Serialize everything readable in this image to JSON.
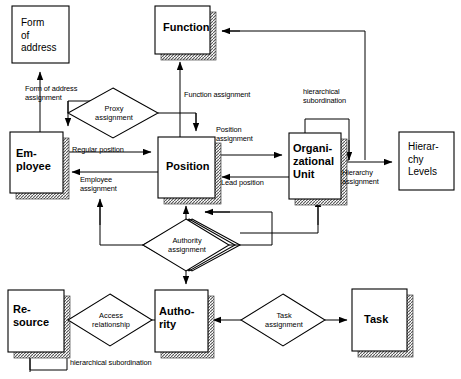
{
  "diagram": {
    "background": "#ffffff",
    "line_color": "#000000",
    "entities": [
      {
        "id": "form-of-address",
        "label": "Form\nof\naddress",
        "style": "plain",
        "x": 12,
        "y": 6,
        "w": 57,
        "h": 57
      },
      {
        "id": "function",
        "label": "Function",
        "style": "shadow",
        "x": 155,
        "y": 6,
        "w": 55,
        "h": 48
      },
      {
        "id": "employee",
        "label": "Em-\nployee",
        "style": "shadow",
        "x": 10,
        "y": 132,
        "w": 53,
        "h": 61
      },
      {
        "id": "position",
        "label": "Position",
        "style": "shadow",
        "x": 158,
        "y": 137,
        "w": 57,
        "h": 61
      },
      {
        "id": "organizational-unit",
        "label": "Organi-\nzational\nUnit",
        "style": "shadow",
        "x": 289,
        "y": 133,
        "w": 52,
        "h": 66
      },
      {
        "id": "hierarchy-levels",
        "label": "Hierar-\nchy\nLevels",
        "style": "plain",
        "x": 399,
        "y": 132,
        "w": 55,
        "h": 58
      },
      {
        "id": "resource",
        "label": "Re-\nsource",
        "style": "shadow",
        "x": 8,
        "y": 290,
        "w": 56,
        "h": 62
      },
      {
        "id": "authority",
        "label": "Autho-\nrity",
        "style": "shadow",
        "x": 155,
        "y": 290,
        "w": 53,
        "h": 62
      },
      {
        "id": "task",
        "label": "Task",
        "style": "shadow",
        "x": 352,
        "y": 289,
        "w": 55,
        "h": 62
      }
    ],
    "relationships": [
      {
        "id": "proxy-assignment",
        "label": "Proxy\nassignment",
        "shape": "diamond",
        "cx": 113,
        "cy": 113,
        "rx": 45,
        "ry": 25
      },
      {
        "id": "authority-assignment",
        "label": "Authority\nassignment",
        "shape": "diamond-stack",
        "cx": 186,
        "cy": 245,
        "rx": 43,
        "ry": 26
      },
      {
        "id": "access-relationship",
        "label": "Access\nrelationship",
        "shape": "diamond",
        "cx": 110,
        "cy": 320,
        "rx": 42,
        "ry": 26
      },
      {
        "id": "task-assignment",
        "label": "Task\nassignment",
        "shape": "diamond",
        "cx": 283,
        "cy": 320,
        "rx": 42,
        "ry": 26
      }
    ],
    "edge_labels": [
      {
        "id": "form-of-address-assignment",
        "text": "Form of address\nassignment",
        "x": 25,
        "y": 84
      },
      {
        "id": "function-assignment",
        "text": "Function assignment",
        "x": 184,
        "y": 90
      },
      {
        "id": "hierarchical-subordination-top",
        "text": "hierarchical\nsubordination",
        "x": 303,
        "y": 87
      },
      {
        "id": "regular-position",
        "text": "Regular position",
        "x": 72,
        "y": 145
      },
      {
        "id": "position-assignment",
        "text": "Position\nassignment",
        "x": 216,
        "y": 125
      },
      {
        "id": "employee-assignment",
        "text": "Employee\nassignment",
        "x": 80,
        "y": 175
      },
      {
        "id": "lead-position",
        "text": "Lead position",
        "x": 221,
        "y": 178
      },
      {
        "id": "hierarchy-assignment",
        "text": "Hierarchy\nassignment",
        "x": 342,
        "y": 168
      },
      {
        "id": "hierarchical-subordination-bottom",
        "text": "hierarchical subordination",
        "x": 70,
        "y": 358
      }
    ]
  }
}
